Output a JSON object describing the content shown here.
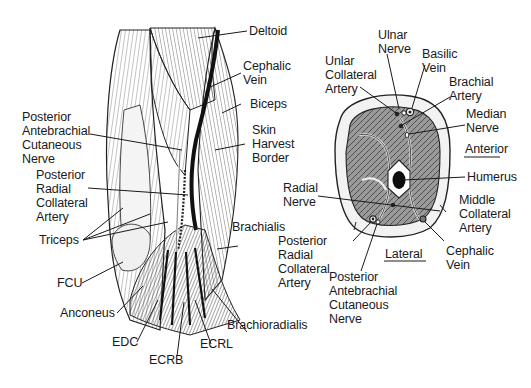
{
  "figure": {
    "left_panel": {
      "description": "Posterior view of the lateral arm (upper arm and elbow) showing muscles and the skin harvest border",
      "labels": {
        "deltoid": "Deltoid",
        "cephalic_vein": "Cephalic\nVein",
        "biceps": "Biceps",
        "skin_harvest_border": "Skin\nHarvest\nBorder",
        "posterior_antebrachial_cutaneous_nerve": "Posterior\nAntebrachial\nCutaneous\nNerve",
        "posterior_radial_collateral_artery": "Posterior\nRadial\nCollateral\nArtery",
        "triceps": "Triceps",
        "brachialis": "Brachialis",
        "fcu": "FCU",
        "anconeus": "Anconeus",
        "brachioradialis": "Brachioradialis",
        "edc": "EDC",
        "ecrb": "ECRB",
        "ecrl": "ECRL"
      }
    },
    "right_panel": {
      "description": "Cross-section of the arm",
      "labels": {
        "ulnar_nerve": "Ulnar\nNerve",
        "basilic_vein": "Basilic\nVein",
        "unlar_collateral_artery": "Unlar\nCollateral\nArtery",
        "brachial_artery": "Brachial\nArtery",
        "median_nerve": "Median\nNerve",
        "anterior": "Anterior",
        "humerus": "Humerus",
        "radial_nerve": "Radial\nNerve",
        "middle_collateral_artery": "Middle\nCollateral\nArtery",
        "posterior_radial_collateral_artery": "Posterior\nRadial\nCollateral\nArtery",
        "lateral": "Lateral",
        "cephalic_vein": "Cephalic\nVein",
        "posterior_antebrachial_cutaneous_nerve": "Posterior\nAntebrachial\nCutaneous\nNerve"
      }
    },
    "colors": {
      "ink": "#1a1a1a",
      "background": "#ffffff",
      "muscle_shade": "#8a8a8a"
    }
  }
}
